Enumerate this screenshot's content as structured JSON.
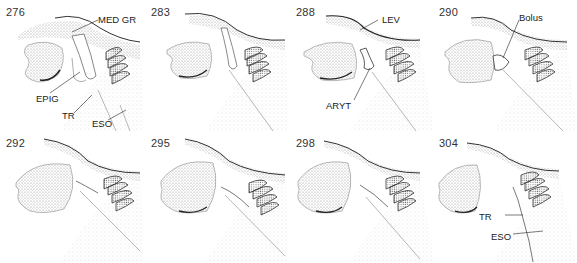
{
  "figure": {
    "panels": [
      {
        "frame": "276",
        "labels": [
          "MED GR",
          "EPIG",
          "TR",
          "ESO"
        ]
      },
      {
        "frame": "283",
        "labels": []
      },
      {
        "frame": "288",
        "labels": [
          "LEV",
          "ARYT"
        ]
      },
      {
        "frame": "290",
        "labels": [
          "Bolus"
        ]
      },
      {
        "frame": "292",
        "labels": []
      },
      {
        "frame": "295",
        "labels": []
      },
      {
        "frame": "298",
        "labels": []
      },
      {
        "frame": "304",
        "labels": [
          "TR",
          "ESO"
        ]
      }
    ]
  },
  "colors": {
    "stipple": "#8a8a8a",
    "outline": "#333333",
    "fold": "#6d6d6d",
    "background": "#ffffff"
  }
}
